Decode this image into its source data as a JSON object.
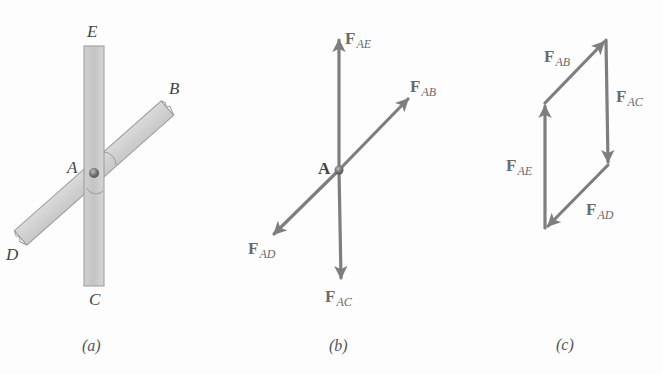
{
  "figure": {
    "panels": [
      {
        "id": "a",
        "caption": "(a)",
        "description": "Two bars pinned at joint A",
        "point_labels": {
          "E": "E",
          "B": "B",
          "A": "A",
          "D": "D",
          "C": "C"
        }
      },
      {
        "id": "b",
        "caption": "(b)",
        "description": "Free-body diagram of pin A",
        "point_label": "A",
        "forces": [
          {
            "base": "F",
            "sub": "AE",
            "direction": "up"
          },
          {
            "base": "F",
            "sub": "AB",
            "direction": "up-right"
          },
          {
            "base": "F",
            "sub": "AD",
            "direction": "down-left"
          },
          {
            "base": "F",
            "sub": "AC",
            "direction": "down"
          }
        ]
      },
      {
        "id": "c",
        "caption": "(c)",
        "description": "Closed force polygon",
        "forces": [
          {
            "base": "F",
            "sub": "AB"
          },
          {
            "base": "F",
            "sub": "AC"
          },
          {
            "base": "F",
            "sub": "AE"
          },
          {
            "base": "F",
            "sub": "AD"
          }
        ]
      }
    ],
    "colors": {
      "bar_fill": "#d2d2d2",
      "bar_stroke": "#9a9a9a",
      "arrow": "#7e7e7e",
      "pin": "#6f6f6f",
      "background": "#fdfdfd"
    }
  }
}
